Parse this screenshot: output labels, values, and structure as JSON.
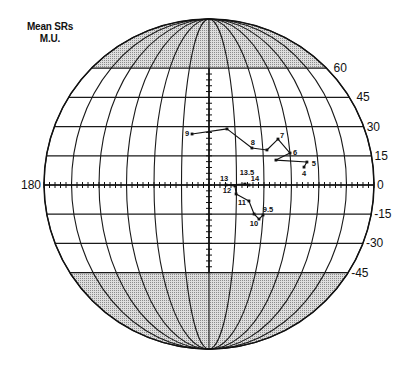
{
  "header": {
    "line1": "Mean SRs",
    "line2": "M.U."
  },
  "chart_data": {
    "type": "line",
    "projection": "globe",
    "title": "Mean SRs M.U.",
    "xlabel": "",
    "ylabel": "",
    "xlim": [
      180,
      0
    ],
    "ylim": [
      -90,
      90
    ],
    "grid": true,
    "legend": "none",
    "meridians": [
      0,
      15,
      30,
      45,
      60,
      75,
      90,
      105,
      120,
      135,
      150,
      165,
      180
    ],
    "parallels": [
      60,
      45,
      30,
      15,
      0,
      -15,
      -30,
      -45
    ],
    "shaded_regions": [
      {
        "from": 60,
        "to": 90
      },
      {
        "from": -90,
        "to": -45
      }
    ],
    "axis_tick_step": 3,
    "y_axis_tick_range": [
      -45,
      57
    ],
    "x_tick_labels": [
      {
        "lon": 180,
        "text": "180",
        "side": "left"
      },
      {
        "lon": 0,
        "text": "0",
        "side": "right"
      }
    ],
    "y_tick_labels": [
      {
        "lat": 60,
        "text": "60"
      },
      {
        "lat": 45,
        "text": "45"
      },
      {
        "lat": 30,
        "text": "30"
      },
      {
        "lat": 15,
        "text": "15"
      },
      {
        "lat": -15,
        "text": "-15"
      },
      {
        "lat": -30,
        "text": "-30"
      },
      {
        "lat": -45,
        "text": "-45"
      }
    ],
    "series": [
      {
        "name": "track-4-to-9",
        "points": [
          {
            "label": "4",
            "lon": 37.9,
            "lat": 9.2,
            "dx": 0,
            "dy": 6
          },
          {
            "label": "5",
            "lon": 36.1,
            "lat": 11.8,
            "dx": 7,
            "dy": 1
          },
          {
            "label": "",
            "lon": 53.1,
            "lat": 12.8,
            "dx": 0,
            "dy": 0
          },
          {
            "label": "6",
            "lon": 45.0,
            "lat": 16.4,
            "dx": 5,
            "dy": -1
          },
          {
            "label": "7",
            "lon": 50.9,
            "lat": 23.6,
            "dx": 4,
            "dy": -4
          },
          {
            "label": "",
            "lon": 57.7,
            "lat": 18.0,
            "dx": 0,
            "dy": 0
          },
          {
            "label": "8",
            "lon": 66.0,
            "lat": 19.0,
            "dx": 1,
            "dy": -6
          },
          {
            "label": "",
            "lon": 79.6,
            "lat": 28.8,
            "dx": 0,
            "dy": 0
          },
          {
            "label": "9",
            "lon": 99.7,
            "lat": 26.2,
            "dx": -5,
            "dy": 0
          }
        ]
      },
      {
        "name": "track-9.5-to-14",
        "points": [
          {
            "label": "9.5",
            "lon": 60.0,
            "lat": -15.4,
            "dx": 5,
            "dy": -5
          },
          {
            "label": "10",
            "lon": 62.1,
            "lat": -17.5,
            "dx": -5,
            "dy": 4
          },
          {
            "label": "",
            "lon": 65.0,
            "lat": -14.9,
            "dx": 0,
            "dy": 0
          },
          {
            "label": "11",
            "lon": 68.1,
            "lat": -8.2,
            "dx": -7,
            "dy": 2
          },
          {
            "label": "",
            "lon": 75.2,
            "lat": -4.6,
            "dx": 0,
            "dy": 0
          },
          {
            "label": "12",
            "lon": 75.8,
            "lat": -0.5,
            "dx": -8,
            "dy": 5
          },
          {
            "label": "13",
            "lon": 80.7,
            "lat": 0.0,
            "dx": -2,
            "dy": -7
          },
          {
            "label": "13.5",
            "lon": 70.4,
            "lat": 0.5,
            "dx": 2,
            "dy": -12
          },
          {
            "label": "14",
            "lon": 68.2,
            "lat": 0.0,
            "dx": 6,
            "dy": -7
          }
        ]
      }
    ]
  }
}
